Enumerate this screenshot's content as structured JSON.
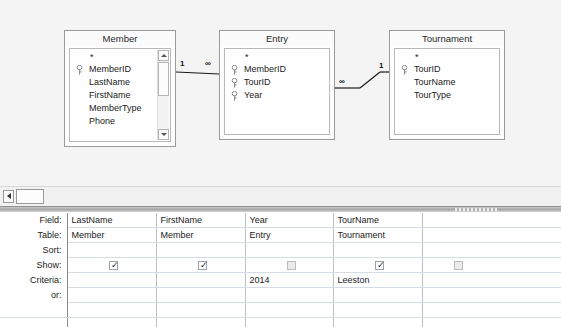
{
  "design_surface": {
    "tables": [
      {
        "name": "Member",
        "star": "*",
        "has_scrollbar": true,
        "fields": [
          {
            "name": "MemberID",
            "key": true
          },
          {
            "name": "LastName",
            "key": false
          },
          {
            "name": "FirstName",
            "key": false
          },
          {
            "name": "MemberType",
            "key": false
          },
          {
            "name": "Phone",
            "key": false
          }
        ]
      },
      {
        "name": "Entry",
        "star": "*",
        "has_scrollbar": false,
        "fields": [
          {
            "name": "MemberID",
            "key": true
          },
          {
            "name": "TourID",
            "key": true
          },
          {
            "name": "Year",
            "key": true
          }
        ]
      },
      {
        "name": "Tournament",
        "star": "*",
        "has_scrollbar": false,
        "fields": [
          {
            "name": "TourID",
            "key": true
          },
          {
            "name": "TourName",
            "key": false
          },
          {
            "name": "TourType",
            "key": false
          }
        ]
      }
    ],
    "relationships": [
      {
        "from": "Member",
        "to": "Entry",
        "from_card": "1",
        "to_card": "∞"
      },
      {
        "from": "Entry",
        "to": "Tournament",
        "from_card": "∞",
        "to_card": "1"
      }
    ]
  },
  "scrollbar": {
    "left_arrow_icon": "triangle-left-icon",
    "thumb_label": ""
  },
  "qbe": {
    "row_labels": [
      "Field:",
      "Table:",
      "Sort:",
      "Show:",
      "Criteria:",
      "or:"
    ],
    "columns": [
      {
        "field": "LastName",
        "table": "Member",
        "sort": "",
        "show": true,
        "criteria": "",
        "or": ""
      },
      {
        "field": "FirstName",
        "table": "Member",
        "sort": "",
        "show": true,
        "criteria": "",
        "or": ""
      },
      {
        "field": "Year",
        "table": "Entry",
        "sort": "",
        "show": false,
        "criteria": "2014",
        "or": ""
      },
      {
        "field": "TourName",
        "table": "Tournament",
        "sort": "",
        "show": true,
        "criteria": "Leeston",
        "or": ""
      },
      {
        "field": "",
        "table": "",
        "sort": "",
        "show": false,
        "criteria": "",
        "or": ""
      }
    ],
    "checkbox_tick": "✓"
  },
  "colors": {
    "surface": "#f4f4f4",
    "grid_line": "#b7bfc9",
    "splitter": "#a8a8a8"
  }
}
